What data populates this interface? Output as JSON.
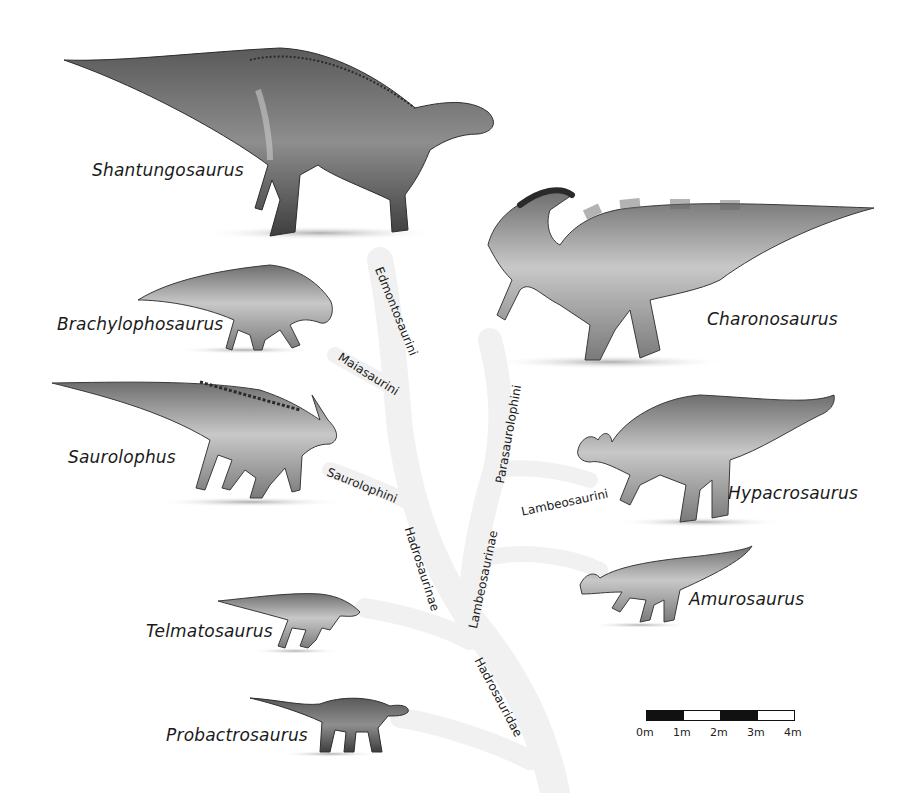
{
  "colors": {
    "background": "#ffffff",
    "tree_branch": "#f1f1f1",
    "text": "#1a1a1a",
    "dinosaur_dark": "#3a3a3a",
    "dinosaur_mid": "#8a8a8a",
    "dinosaur_light": "#cfcfcf",
    "shadow": "#bdbdbd"
  },
  "taxa": [
    {
      "name": "Shantungosaurus",
      "group": "Edmontosaurini"
    },
    {
      "name": "Brachylophosaurus",
      "group": "Maiasaurini"
    },
    {
      "name": "Saurolophus",
      "group": "Saurolophini"
    },
    {
      "name": "Telmatosaurus",
      "group": "outside Hadrosaurinae/Lambeosaurinae"
    },
    {
      "name": "Probactrosaurus",
      "group": "outside Hadrosauridae"
    },
    {
      "name": "Charonosaurus",
      "group": "Parasaurolophini"
    },
    {
      "name": "Hypacrosaurus",
      "group": "Lambeosaurini"
    },
    {
      "name": "Amurosaurus",
      "group": "Lambeosaurinae"
    }
  ],
  "clades": {
    "edmontosaurini": "Edmontosaurini",
    "maiasaurini": "Maiasaurini",
    "saurolophini": "Saurolophini",
    "hadrosaurinae": "Hadrosaurinae",
    "parasaurolophini": "Parasaurolophini",
    "lambeosaurini": "Lambeosaurini",
    "lambeosaurinae": "Lambeosaurinae",
    "hadrosauridae": "Hadrosauridae"
  },
  "scale_bar": {
    "ticks": [
      "0m",
      "1m",
      "2m",
      "3m",
      "4m"
    ],
    "segments": [
      "black",
      "white",
      "black",
      "white"
    ]
  }
}
